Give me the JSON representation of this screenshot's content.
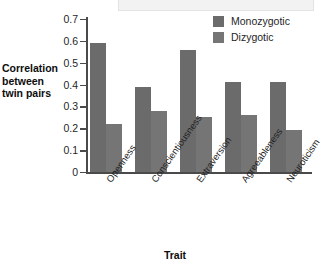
{
  "chart_data": {
    "type": "bar",
    "title": "",
    "subtitle": "",
    "xlabel": "Trait",
    "ylabel": "Correlation between twin pairs",
    "ylabel_lines": [
      "Correlation",
      "between",
      "twin pairs"
    ],
    "categories": [
      "Openness",
      "Conscientiousness",
      "Extraversion",
      "Agreeableness",
      "Neuroticism"
    ],
    "series": [
      {
        "name": "Monozygotic",
        "color": "#6b6b6b",
        "values": [
          0.59,
          0.39,
          0.56,
          0.41,
          0.41
        ]
      },
      {
        "name": "Dizygotic",
        "color": "#757575",
        "values": [
          0.22,
          0.28,
          0.25,
          0.26,
          0.19
        ]
      }
    ],
    "ylim": [
      0,
      0.7
    ],
    "ytick_step": 0.1,
    "ytick_labels": [
      "0.7",
      "0.6",
      "0.5",
      "0.4",
      "0.3",
      "0.2",
      "0.1",
      "0"
    ],
    "ytick_values": [
      0.7,
      0.6,
      0.5,
      0.4,
      0.3,
      0.2,
      0.1,
      0
    ],
    "grid": false,
    "legend_position": "top-right",
    "category_label_rotation_deg": -55,
    "axis_color": "#4a4a4a",
    "background_color": "#ffffff"
  },
  "legend": {
    "entries": [
      {
        "label": "Monozygotic",
        "color": "#6b6b6b"
      },
      {
        "label": "Dizygotic",
        "color": "#757575"
      }
    ]
  },
  "axes": {
    "y_title_line1": "Correlation",
    "y_title_line2": "between",
    "y_title_line3": "twin pairs",
    "x_title": "Trait"
  }
}
